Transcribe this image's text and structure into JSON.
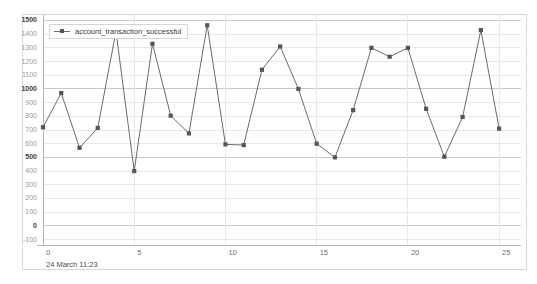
{
  "chart_data": {
    "type": "line",
    "title": "",
    "subtitle": "",
    "xlabel": "",
    "ylabel": "",
    "x": [
      0,
      1,
      2,
      3,
      4,
      5,
      6,
      7,
      8,
      9,
      10,
      11,
      12,
      13,
      14,
      15,
      16,
      17,
      18,
      19,
      20,
      21,
      22,
      23,
      24,
      25
    ],
    "series": [
      {
        "name": "account_transaction_successful",
        "color": "#6b6b6b",
        "marker": "square",
        "values": [
          720,
          970,
          570,
          715,
          1420,
          400,
          1330,
          805,
          675,
          1465,
          595,
          590,
          1140,
          1310,
          1000,
          600,
          500,
          845,
          1300,
          1235,
          1300,
          855,
          505,
          795,
          1430,
          710
        ]
      }
    ],
    "xlim": [
      0,
      26.2
    ],
    "ylim": [
      -140,
      1540
    ],
    "xticks": [
      0,
      5,
      10,
      15,
      20,
      25
    ],
    "xtick_labels": [
      "0",
      "5",
      "10",
      "15",
      "20",
      "25"
    ],
    "yticks": [
      -100,
      0,
      100,
      200,
      300,
      400,
      500,
      600,
      700,
      800,
      900,
      1000,
      1100,
      1200,
      1300,
      1400,
      1500
    ],
    "ytick_labels": [
      "-100",
      "0",
      "100",
      "200",
      "300",
      "400",
      "500",
      "600",
      "700",
      "800",
      "900",
      "1000",
      "1100",
      "1200",
      "1300",
      "1400",
      "1500"
    ],
    "ytick_major": [
      0,
      500,
      1000,
      1500
    ],
    "grid": true,
    "grid_color": "#e8e8e8",
    "grid_major_color": "#c9c9c9",
    "legend_position": "top-left",
    "axis_caption": "24 March 11:23",
    "background": "#ffffff",
    "border_color": "#d8d8d8"
  },
  "legend": {
    "entries": [
      {
        "label": "account_transaction_successful"
      }
    ]
  },
  "footer": {
    "timestamp": "24 March 11:23"
  }
}
